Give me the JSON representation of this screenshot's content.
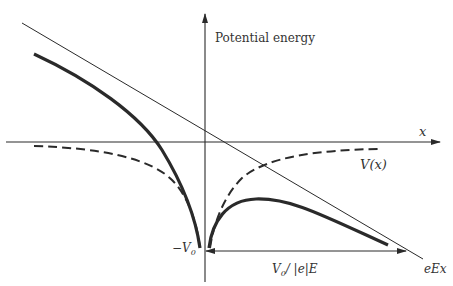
{
  "diagram": {
    "labels": {
      "y_axis": "Potential energy",
      "x_axis": "x",
      "dashed_curve": "V(x)",
      "minus_v0": "−V",
      "minus_v0_sub": "0",
      "distance_label_v": "V",
      "distance_label_sub": "0",
      "distance_label_rest": "/ |e|E",
      "field_line": "eEx"
    },
    "curves": [
      {
        "name": "image-potential",
        "style": "dashed",
        "description": "V(x), image potential, symmetric about vertical axis, approaching 0 at large |x|"
      },
      {
        "name": "total-potential",
        "style": "thick-solid",
        "description": "V(x) + eEx, combined potential with peak (barrier) right of origin"
      },
      {
        "name": "applied-field-line",
        "style": "thin-solid",
        "description": "eEx, linear potential from applied field"
      },
      {
        "name": "axes",
        "style": "thin-solid",
        "description": "x axis and potential energy axis with arrows"
      }
    ],
    "colors": {
      "ink": "#2a2a2a",
      "background": "#ffffff"
    }
  }
}
